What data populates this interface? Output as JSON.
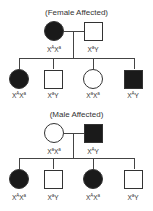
{
  "pedigrees": [
    {
      "title": "(Female Affected)",
      "parents": [
        {
          "sex": "female",
          "affected": true,
          "genotype": {
            "base1": "X",
            "sup1": "A",
            "base2": "X",
            "sup2": "a"
          }
        },
        {
          "sex": "male",
          "affected": false,
          "genotype": {
            "base1": "X",
            "sup1": "a",
            "base2": "Y",
            "sup2": ""
          }
        }
      ],
      "children": [
        {
          "sex": "female",
          "affected": true,
          "genotype": {
            "base1": "X",
            "sup1": "A",
            "base2": "X",
            "sup2": "a"
          }
        },
        {
          "sex": "male",
          "affected": false,
          "genotype": {
            "base1": "X",
            "sup1": "a",
            "base2": "Y",
            "sup2": ""
          }
        },
        {
          "sex": "female",
          "affected": false,
          "genotype": {
            "base1": "X",
            "sup1": "a",
            "base2": "X",
            "sup2": "a"
          }
        },
        {
          "sex": "male",
          "affected": true,
          "genotype": {
            "base1": "X",
            "sup1": "A",
            "base2": "Y",
            "sup2": ""
          }
        }
      ]
    },
    {
      "title": "(Male Affected)",
      "parents": [
        {
          "sex": "female",
          "affected": false,
          "genotype": {
            "base1": "X",
            "sup1": "a",
            "base2": "X",
            "sup2": "a"
          }
        },
        {
          "sex": "male",
          "affected": true,
          "genotype": {
            "base1": "X",
            "sup1": "A",
            "base2": "Y",
            "sup2": ""
          }
        }
      ],
      "children": [
        {
          "sex": "female",
          "affected": true,
          "genotype": {
            "base1": "X",
            "sup1": "A",
            "base2": "X",
            "sup2": "a"
          }
        },
        {
          "sex": "male",
          "affected": false,
          "genotype": {
            "base1": "X",
            "sup1": "a",
            "base2": "Y",
            "sup2": ""
          }
        },
        {
          "sex": "female",
          "affected": true,
          "genotype": {
            "base1": "X",
            "sup1": "A",
            "base2": "X",
            "sup2": "a"
          }
        },
        {
          "sex": "male",
          "affected": false,
          "genotype": {
            "base1": "X",
            "sup1": "a",
            "base2": "Y",
            "sup2": ""
          }
        }
      ]
    }
  ]
}
